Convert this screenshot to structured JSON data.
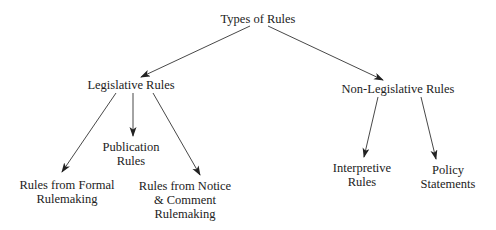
{
  "diagram": {
    "title": "Types of Rules",
    "colors": {
      "text": "#222222",
      "line": "#333333",
      "background": "#ffffff"
    },
    "nodes": {
      "root": {
        "lines": [
          "Types of Rules"
        ]
      },
      "legislative": {
        "lines": [
          "Legislative Rules"
        ]
      },
      "non_legislative": {
        "lines": [
          "Non-Legislative Rules"
        ]
      },
      "formal": {
        "lines": [
          "Rules from Formal",
          "Rulemaking"
        ]
      },
      "publication": {
        "lines": [
          "Publication",
          "Rules"
        ]
      },
      "notice_comment": {
        "lines": [
          "Rules from Notice",
          "& Comment",
          "Rulemaking"
        ]
      },
      "interpretive": {
        "lines": [
          "Interpretive",
          "Rules"
        ]
      },
      "policy": {
        "lines": [
          "Policy",
          "Statements"
        ]
      }
    },
    "edges": [
      {
        "from": "root",
        "to": "legislative"
      },
      {
        "from": "root",
        "to": "non_legislative"
      },
      {
        "from": "legislative",
        "to": "formal"
      },
      {
        "from": "legislative",
        "to": "publication"
      },
      {
        "from": "legislative",
        "to": "notice_comment"
      },
      {
        "from": "non_legislative",
        "to": "interpretive"
      },
      {
        "from": "non_legislative",
        "to": "policy"
      }
    ]
  }
}
